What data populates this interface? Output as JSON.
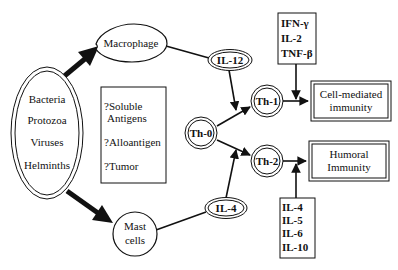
{
  "diagram": {
    "pathogens": {
      "items": [
        "Bacteria",
        "Protozoa",
        "Viruses",
        "Helminths"
      ]
    },
    "antigens": {
      "line1": "?Soluble",
      "line2": "Antigens",
      "line3": "?Alloantigen",
      "line4": "?Tumor"
    },
    "macrophage": "Macrophage",
    "mast_cells": {
      "line1": "Mast",
      "line2": "cells"
    },
    "il12": "IL-12",
    "il4": "IL-4",
    "th0": "Th-0",
    "th1": "Th-1",
    "th2": "Th-2",
    "th1_cytokines": [
      "IFN-γ",
      "IL-2",
      "TNF-β"
    ],
    "th2_cytokines": [
      "IL-4",
      "IL-5",
      "IL-6",
      "IL-10"
    ],
    "cell_mediated": {
      "line1": "Cell-mediated",
      "line2": "immunity"
    },
    "humoral": {
      "line1": "Humoral",
      "line2": "Immunity"
    },
    "colors": {
      "stroke": "#111111",
      "background": "#ffffff"
    }
  }
}
